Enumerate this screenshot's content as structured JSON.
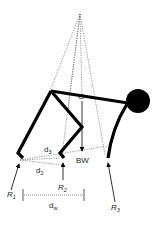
{
  "diagram": {
    "type": "biomechanics-free-body-diagram",
    "labels": {
      "G": "G",
      "BW": "BW",
      "d3": {
        "base": "d",
        "sub": "3"
      },
      "d2": {
        "base": "d",
        "sub": "2"
      },
      "dw": {
        "base": "d",
        "sub": "w"
      },
      "R1": {
        "base": "R",
        "sub": "1"
      },
      "R2": {
        "base": "R",
        "sub": "2"
      },
      "R3": {
        "base": "R",
        "sub": "3"
      }
    },
    "colors": {
      "limb": "#000000",
      "dashed": "#555555",
      "background": "#ffffff"
    }
  }
}
